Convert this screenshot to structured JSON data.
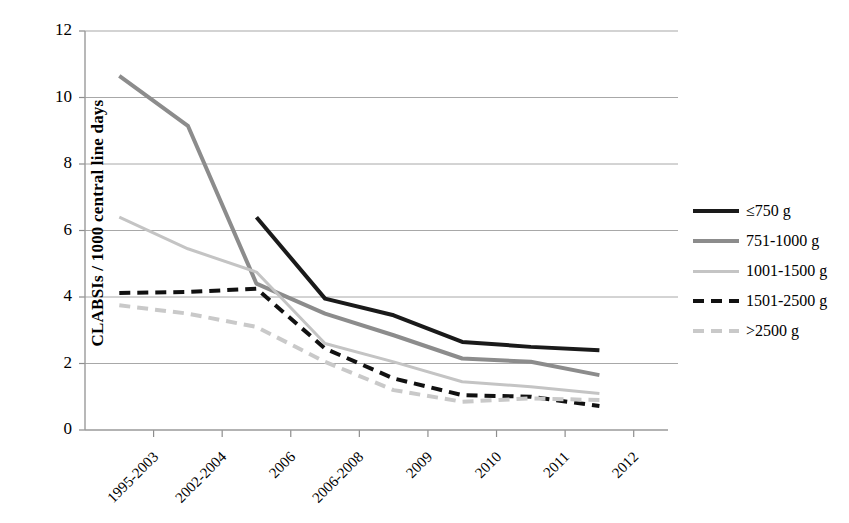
{
  "chart_data": {
    "type": "line",
    "title": "",
    "xlabel": "",
    "ylabel": "CLABSIs / 1000 central line days",
    "categories": [
      "1995-2003",
      "2002-2004",
      "2006",
      "2006-2008",
      "2009",
      "2010",
      "2011",
      "2012"
    ],
    "ylim": [
      0,
      12
    ],
    "yticks": [
      0,
      2,
      4,
      6,
      8,
      10,
      12
    ],
    "grid": true,
    "legend_position": "right",
    "series": [
      {
        "name": "≤750 g",
        "color": "#1a1a1a",
        "style": "solid",
        "width": 4,
        "values": [
          null,
          null,
          6.4,
          3.95,
          3.45,
          2.65,
          2.5,
          2.4
        ]
      },
      {
        "name": "751-1000 g",
        "color": "#8c8c8c",
        "style": "solid",
        "width": 4,
        "values": [
          10.65,
          9.15,
          4.4,
          3.5,
          2.85,
          2.15,
          2.05,
          1.65
        ]
      },
      {
        "name": "1001-1500 g",
        "color": "#c4c4c4",
        "style": "solid",
        "width": 3,
        "values": [
          6.4,
          5.45,
          4.75,
          2.6,
          2.05,
          1.45,
          1.3,
          1.1
        ]
      },
      {
        "name": "1501-2500 g",
        "color": "#111111",
        "style": "dashed",
        "width": 4,
        "values": [
          4.12,
          4.15,
          4.25,
          2.45,
          1.55,
          1.05,
          1.0,
          0.72
        ]
      },
      {
        "name": ">2500 g",
        "color": "#c9c9c9",
        "style": "dashed",
        "width": 4,
        "values": [
          3.75,
          3.5,
          3.1,
          2.05,
          1.2,
          0.85,
          0.95,
          0.9
        ]
      }
    ]
  },
  "axis": {
    "y_tick_labels": [
      "12",
      "10",
      "8",
      "6",
      "4",
      "2",
      "0"
    ],
    "y_title": "CLABSIs / 1000 central line days",
    "x_tick_labels": [
      "1995-2003",
      "2002-2004",
      "2006",
      "2006-2008",
      "2009",
      "2010",
      "2011",
      "2012"
    ]
  },
  "legend": {
    "items": [
      {
        "label": "≤750 g"
      },
      {
        "label": "751-1000 g"
      },
      {
        "label": "1001-1500 g"
      },
      {
        "label": "1501-2500 g"
      },
      {
        "label": ">2500 g"
      }
    ]
  }
}
